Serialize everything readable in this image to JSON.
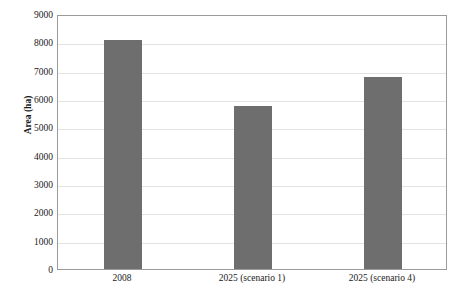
{
  "chart_data": {
    "type": "bar",
    "title": "",
    "xlabel": "",
    "ylabel": "Area (ha)",
    "categories": [
      "2008",
      "2025 (scenario 1)",
      "2025 (scenario 4)"
    ],
    "values": [
      8100,
      5750,
      6780
    ],
    "ylim": [
      0,
      9000
    ],
    "yticks": [
      0,
      1000,
      2000,
      3000,
      4000,
      5000,
      6000,
      7000,
      8000,
      9000
    ],
    "ytick_labels": [
      "0",
      "1000",
      "2000",
      "3000",
      "4000",
      "5000",
      "6000",
      "7000",
      "8000",
      "9000"
    ],
    "grid": true,
    "legend": "none",
    "bar_color": "#6e6e6e",
    "series": [
      {
        "name": "Area",
        "values": [
          8100,
          5750,
          6780
        ]
      }
    ]
  },
  "axes": {
    "y_title": "Area (ha)",
    "frame_color": "#9a9a9a",
    "gridline_color": "#e2e2e2",
    "background": "#ffffff"
  },
  "artifacts": {
    "top_fragment": "",
    "bottom_fragment": ""
  }
}
